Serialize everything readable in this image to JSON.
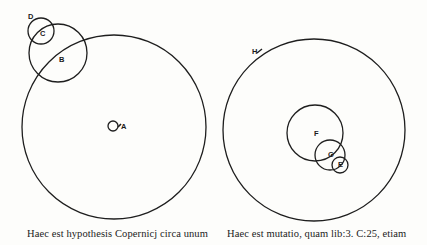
{
  "figure_left": {
    "caption": "Haec est hypothesis Copernicj circa unum",
    "circles": [
      {
        "id": "deferent-left",
        "cx": 114,
        "cy": 127,
        "r": 92
      },
      {
        "id": "circle-B",
        "cx": 58,
        "cy": 53,
        "r": 29
      },
      {
        "id": "circle-C",
        "cx": 41,
        "cy": 31,
        "r": 13
      },
      {
        "id": "circle-A",
        "cx": 113,
        "cy": 126,
        "r": 5
      }
    ],
    "labels": {
      "A": "A",
      "B": "B",
      "C": "C",
      "D": "D"
    }
  },
  "figure_right": {
    "caption": "Haec est mutatio, quam lib:3. C:25, etiam",
    "circles": [
      {
        "id": "deferent-right",
        "cx": 314,
        "cy": 130,
        "r": 91
      },
      {
        "id": "circle-F",
        "cx": 315,
        "cy": 133,
        "r": 28
      },
      {
        "id": "circle-G",
        "cx": 330,
        "cy": 155,
        "r": 15
      },
      {
        "id": "circle-E",
        "cx": 340,
        "cy": 165,
        "r": 8
      }
    ],
    "labels": {
      "H": "H",
      "F": "F",
      "G": "G",
      "E": "E"
    }
  },
  "style": {
    "stroke_color": "#1e1e1e",
    "background": "#fdfdfb"
  }
}
